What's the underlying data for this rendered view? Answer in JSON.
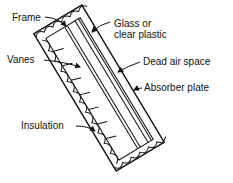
{
  "diagram": {
    "labels": {
      "frame": "Frame",
      "glass_line1": "Glass or",
      "glass_line2": "clear plastic",
      "vanes": "Vanes",
      "dead_air": "Dead air space",
      "absorber": "Absorber plate",
      "insulation": "Insulation"
    },
    "colors": {
      "ink": "#111111",
      "background": "#ffffff"
    }
  }
}
